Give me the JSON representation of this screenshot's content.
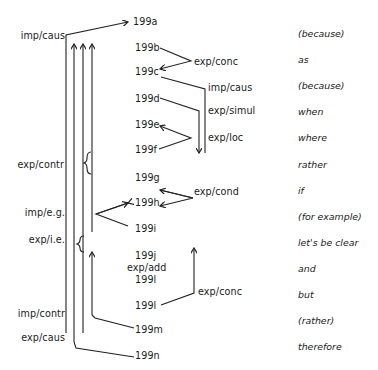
{
  "sentences": [
    {
      "id": "199a",
      "gloss": "(because)"
    },
    {
      "id": "199b",
      "gloss": "as"
    },
    {
      "id": "199c",
      "gloss": "(because)"
    },
    {
      "id": "199d",
      "gloss": "when"
    },
    {
      "id": "199e",
      "gloss": "where"
    },
    {
      "id": "199f",
      "gloss": "rather"
    },
    {
      "id": "199g",
      "gloss": "if"
    },
    {
      "id": "199h",
      "gloss": "(for example)"
    },
    {
      "id": "199i",
      "gloss": "let's be clear"
    },
    {
      "id": "199j",
      "gloss": "and"
    },
    {
      "id": "199l",
      "gloss": "but"
    },
    {
      "id": "199l",
      "gloss": "(rather)"
    },
    {
      "id": "199m",
      "gloss": "therefore"
    },
    {
      "id": "199n",
      "gloss": ""
    }
  ],
  "nodes": {
    "a": "199a",
    "b": "199b",
    "c": "199c",
    "d": "199d",
    "e": "199e",
    "f": "199f",
    "g": "199g",
    "h": "199h",
    "i": "199i",
    "j": "199j",
    "l1": "199l",
    "l2": "199l",
    "m": "199m",
    "n": "199n"
  },
  "relations_left": {
    "imp_caus": "imp/caus",
    "exp_contr": "exp/contr",
    "imp_eg": "imp/e.g.",
    "exp_ie": "exp/i.e.",
    "imp_contr": "imp/contr",
    "exp_caus": "exp/caus"
  },
  "relations_right": {
    "exp_conc_top": "exp/conc",
    "imp_caus": "imp/caus",
    "exp_simul": "exp/simul",
    "exp_loc": "exp/loc",
    "exp_cond": "exp/cond",
    "exp_add": "exp/add",
    "exp_conc_bottom": "exp/conc"
  },
  "glosses": {
    "g1": "(because)",
    "g2": "as",
    "g3": "(because)",
    "g4": "when",
    "g5": "where",
    "g6": "rather",
    "g7": "if",
    "g8": "(for example)",
    "g9": "let's be clear",
    "g10": "and",
    "g11": "but",
    "g12": "(rather)",
    "g13": "therefore"
  }
}
